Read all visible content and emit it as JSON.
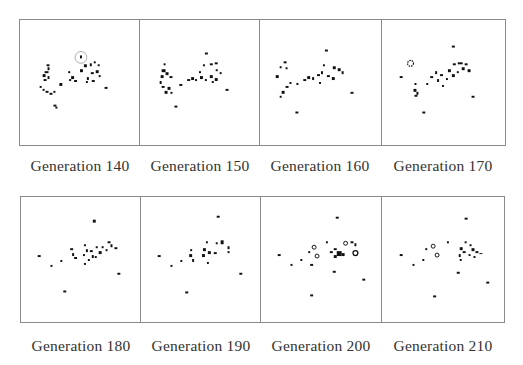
{
  "figure": {
    "panels": [
      {
        "label": "Generation 140",
        "generation": 140,
        "highlight_circle": true
      },
      {
        "label": "Generation 150",
        "generation": 150
      },
      {
        "label": "Generation 160",
        "generation": 160
      },
      {
        "label": "Generation 170",
        "generation": 170
      },
      {
        "label": "Generation 180",
        "generation": 180
      },
      {
        "label": "Generation 190",
        "generation": 190
      },
      {
        "label": "Generation 200",
        "generation": 200
      },
      {
        "label": "Generation 210",
        "generation": 210
      }
    ],
    "colors": {
      "cell": "#111111",
      "border": "#8a8a8a",
      "caption": "#333333",
      "highlight": "#999999"
    }
  }
}
